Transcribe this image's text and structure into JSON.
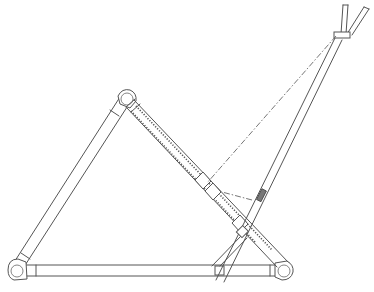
{
  "figure": {
    "title": "",
    "width": 374,
    "height": 292,
    "line_color": "#555555",
    "background": "#ffffff"
  },
  "parts": {
    "base_bar": {
      "x1": 22,
      "y1": 270,
      "x2": 283,
      "y2": 270,
      "thickness": 10
    },
    "left_leg": {
      "x1": 18,
      "y1": 268,
      "x2": 126,
      "y2": 102,
      "thickness": 10
    },
    "top_hinge": {
      "cx": 127,
      "cy": 100,
      "r": 9
    },
    "left_foot_hinge": {
      "cx": 18,
      "cy": 270,
      "r": 8
    },
    "right_foot_hinge": {
      "cx": 284,
      "cy": 271,
      "r": 8
    },
    "ratchet_strut": {
      "x1": 133,
      "y1": 104,
      "x2": 283,
      "y2": 265,
      "thickness": 14
    },
    "strut_collars": [
      {
        "cx": 203,
        "cy": 182
      },
      {
        "cx": 213,
        "cy": 193
      },
      {
        "cx": 240,
        "cy": 225
      }
    ],
    "diagonal_pole": {
      "x1": 222,
      "y1": 280,
      "x2": 338,
      "y2": 38,
      "thickness": 6
    },
    "pole_band": {
      "cx": 262,
      "cy": 197
    },
    "fork_top": [
      {
        "x1": 343,
        "y1": 36,
        "x2": 346,
        "y2": 5
      },
      {
        "x1": 347,
        "y1": 36,
        "x2": 366,
        "y2": 8
      }
    ],
    "fork_clamp": {
      "x": 335,
      "y": 33,
      "w": 14,
      "h": 6
    },
    "dash_line": {
      "x1": 338,
      "y1": 38,
      "x2": 205,
      "y2": 186
    },
    "inner_tie": {
      "x1": 245,
      "y1": 230,
      "x2": 214,
      "y2": 262
    }
  }
}
